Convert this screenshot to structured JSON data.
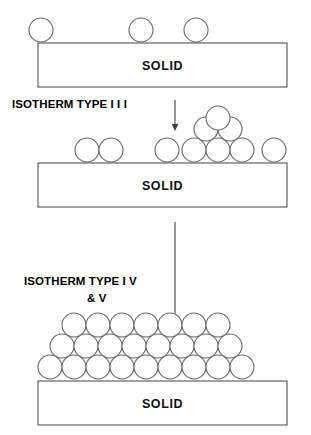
{
  "figure": {
    "background_color": "#ffffff",
    "stroke_color": "#555555",
    "particle_fill": "#ffffff",
    "text_color": "#000000"
  },
  "panels": [
    {
      "id": "panel-monolayer-sparse",
      "substrate_label": "SOLID",
      "substrate": {
        "x": 38,
        "y": 43,
        "width": 249,
        "height": 44
      },
      "particles": [
        {
          "cx": 41,
          "cy": 30,
          "r": 12
        },
        {
          "cx": 141,
          "cy": 30,
          "r": 12
        },
        {
          "cx": 196,
          "cy": 30,
          "r": 12
        }
      ],
      "particle_count": 3,
      "rows": [
        3
      ]
    },
    {
      "id": "panel-clustered",
      "substrate_label": "SOLID",
      "substrate": {
        "x": 38,
        "y": 163,
        "width": 249,
        "height": 44
      },
      "particles": [
        {
          "cx": 87,
          "cy": 150,
          "r": 12
        },
        {
          "cx": 111,
          "cy": 150,
          "r": 12
        },
        {
          "cx": 167,
          "cy": 150,
          "r": 12
        },
        {
          "cx": 194,
          "cy": 150,
          "r": 12
        },
        {
          "cx": 218,
          "cy": 150,
          "r": 12
        },
        {
          "cx": 242,
          "cy": 150,
          "r": 12
        },
        {
          "cx": 274,
          "cy": 150,
          "r": 12
        },
        {
          "cx": 206,
          "cy": 129,
          "r": 12
        },
        {
          "cx": 230,
          "cy": 129,
          "r": 12
        },
        {
          "cx": 218,
          "cy": 118,
          "r": 12
        }
      ],
      "particle_count": 10,
      "cluster_rows": [
        3,
        2,
        1
      ]
    },
    {
      "id": "panel-multilayer",
      "substrate_label": "SOLID",
      "substrate": {
        "x": 38,
        "y": 381,
        "width": 249,
        "height": 44
      },
      "rows": [
        {
          "name": "bottom-row",
          "count": 9,
          "cy": 367,
          "start_cx": 50,
          "spacing": 24,
          "r": 12
        },
        {
          "name": "middle-row",
          "count": 8,
          "cy": 346,
          "start_cx": 62,
          "spacing": 24,
          "r": 12
        },
        {
          "name": "top-row",
          "count": 7,
          "cy": 325,
          "start_cx": 74,
          "spacing": 24,
          "r": 12
        }
      ],
      "particle_count": 24
    }
  ],
  "labels": [
    {
      "id": "isotherm-type-iii",
      "text": "ISOTHERM TYPE I I I",
      "x": 12,
      "y": 108
    },
    {
      "id": "isotherm-type-iv-v-line1",
      "text": "ISOTHERM TYPE  I V",
      "x": 24,
      "y": 285
    },
    {
      "id": "isotherm-type-iv-v-line2",
      "text": "& V",
      "x": 87,
      "y": 302
    }
  ],
  "arrows": [
    {
      "id": "arrow-top-to-middle",
      "x": 175,
      "y_start": 100,
      "y_end": 131
    },
    {
      "id": "arrow-middle-to-bottom",
      "x": 175,
      "y_start": 222,
      "y_end": 330
    }
  ]
}
